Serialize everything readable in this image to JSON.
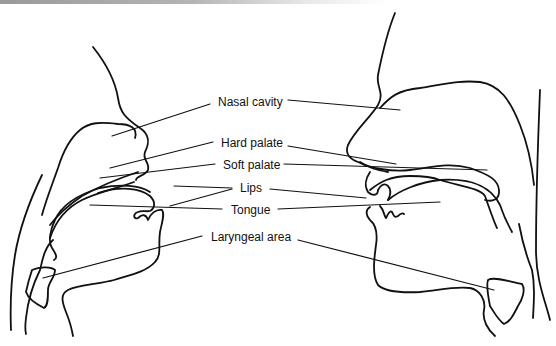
{
  "figure": {
    "type": "anatomical-diagram",
    "labels": [
      {
        "id": "nasal",
        "text": "Nasal cavity",
        "x": 218,
        "y": 94
      },
      {
        "id": "hard",
        "text": "Hard palate",
        "x": 221,
        "y": 135
      },
      {
        "id": "soft",
        "text": "Soft palate",
        "x": 223,
        "y": 158
      },
      {
        "id": "lips",
        "text": "Lips",
        "x": 241,
        "y": 181
      },
      {
        "id": "tongue",
        "text": "Tongue",
        "x": 230,
        "y": 203
      },
      {
        "id": "laryngeal",
        "text": "Laryngeal area",
        "x": 212,
        "y": 230
      }
    ],
    "colors": {
      "line": "#111111",
      "background": "#ffffff"
    }
  }
}
